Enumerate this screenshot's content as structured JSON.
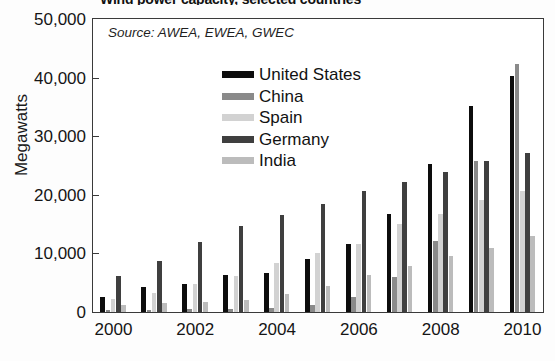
{
  "title": "Wind power capacity, selected countries",
  "source_note": "Source: AWEA, EWEA, GWEC",
  "axes": {
    "ylabel": "Megawatts",
    "xlabel": "",
    "y_ticks": [
      "0",
      "10,000",
      "20,000",
      "30,000",
      "40,000",
      "50,000"
    ],
    "x_ticks": [
      "2000",
      "2002",
      "2004",
      "2006",
      "2008",
      "2010"
    ]
  },
  "legend": {
    "position": "inside-top-center",
    "entries": [
      {
        "label": "United States",
        "color": "#0d0d0d"
      },
      {
        "label": "China",
        "color": "#8a8a8a"
      },
      {
        "label": "Spain",
        "color": "#d2d2d2"
      },
      {
        "label": "Germany",
        "color": "#3f3f3f"
      },
      {
        "label": "India",
        "color": "#bcbcbc"
      }
    ]
  },
  "chart_data": {
    "type": "bar",
    "title": "Wind power capacity, selected countries",
    "subtitle": "Source: AWEA, EWEA, GWEC",
    "xlabel": "",
    "ylabel": "Megawatts",
    "ylim": [
      0,
      50000
    ],
    "ytick_step": 10000,
    "grid": false,
    "legend_position": "inside-top-center",
    "categories": [
      "2000",
      "2001",
      "2002",
      "2003",
      "2004",
      "2005",
      "2006",
      "2007",
      "2008",
      "2009",
      "2010"
    ],
    "series": [
      {
        "name": "United States",
        "color": "#0d0d0d",
        "values": [
          2500,
          4200,
          4700,
          6400,
          6700,
          9100,
          11600,
          16800,
          25200,
          35100,
          40200
        ]
      },
      {
        "name": "China",
        "color": "#8a8a8a",
        "values": [
          350,
          400,
          470,
          570,
          760,
          1270,
          2600,
          6000,
          12200,
          25800,
          42300
        ]
      },
      {
        "name": "Spain",
        "color": "#d2d2d2",
        "values": [
          2200,
          3300,
          4800,
          6200,
          8300,
          10000,
          11600,
          15100,
          16700,
          19100,
          20600
        ]
      },
      {
        "name": "Germany",
        "color": "#3f3f3f",
        "values": [
          6100,
          8750,
          12000,
          14600,
          16600,
          18400,
          20600,
          22200,
          23900,
          25800,
          27200
        ]
      },
      {
        "name": "India",
        "color": "#bcbcbc",
        "values": [
          1200,
          1500,
          1700,
          2100,
          3000,
          4400,
          6300,
          7800,
          9600,
          10900,
          13000
        ]
      }
    ]
  }
}
